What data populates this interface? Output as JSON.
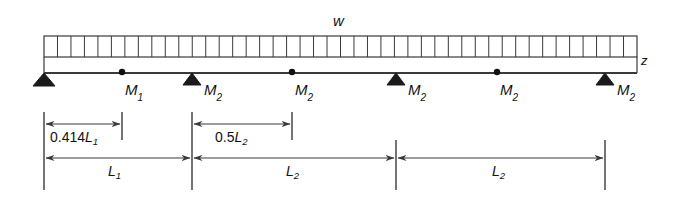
{
  "figure": {
    "load_label": "w",
    "break_symbol": "z",
    "colors": {
      "line": "#3a3a3a",
      "text": "#111111",
      "support_fill": "#1a1a1a",
      "hinge_fill": "#111111"
    }
  },
  "beam": {
    "x_start": 44,
    "x_end": 637,
    "y": 73,
    "load_top": 36,
    "load_bottom": 57,
    "hatch_count": 44
  },
  "supports": [
    {
      "id": "support-1",
      "x": 44,
      "label": ""
    },
    {
      "id": "support-2",
      "x": 192,
      "label": "M"
    },
    {
      "id": "support-3",
      "x": 396,
      "label": "M"
    },
    {
      "id": "support-4",
      "x": 605,
      "label": "M"
    }
  ],
  "moment_labels": [
    {
      "name": "moment-label-1",
      "text": "M",
      "sub": "1",
      "x": 125,
      "y": 82
    },
    {
      "name": "moment-label-2",
      "text": "M",
      "sub": "2",
      "x": 204,
      "y": 82
    },
    {
      "name": "moment-label-3",
      "text": "M",
      "sub": "2",
      "x": 295,
      "y": 82
    },
    {
      "name": "moment-label-4",
      "text": "M",
      "sub": "2",
      "x": 408,
      "y": 82
    },
    {
      "name": "moment-label-5",
      "text": "M",
      "sub": "2",
      "x": 500,
      "y": 82
    },
    {
      "name": "moment-label-6",
      "text": "M",
      "sub": "2",
      "x": 617,
      "y": 82
    }
  ],
  "hinges": [
    {
      "name": "hinge-point-1",
      "x": 122,
      "y": 72
    },
    {
      "name": "hinge-point-2",
      "x": 292,
      "y": 72
    },
    {
      "name": "hinge-point-3",
      "x": 497,
      "y": 72
    }
  ],
  "dimensions": [
    {
      "name": "dimension-0414L1",
      "coefficient": "0.414",
      "symbol": "L",
      "sub": "1",
      "x1": 44,
      "x2": 122,
      "y": 124,
      "label_x": 50,
      "label_y": 130
    },
    {
      "name": "dimension-05L2",
      "coefficient": "0.5",
      "symbol": "L",
      "sub": "2",
      "x1": 192,
      "x2": 292,
      "y": 124,
      "label_x": 215,
      "label_y": 130
    },
    {
      "name": "dimension-L1",
      "coefficient": "",
      "symbol": "L",
      "sub": "1",
      "x1": 44,
      "x2": 192,
      "y": 158,
      "label_x": 108,
      "label_y": 164
    },
    {
      "name": "dimension-L2-first",
      "coefficient": "",
      "symbol": "L",
      "sub": "2",
      "x1": 192,
      "x2": 396,
      "y": 158,
      "label_x": 286,
      "label_y": 164
    },
    {
      "name": "dimension-L2-second",
      "coefficient": "",
      "symbol": "L",
      "sub": "2",
      "x1": 396,
      "x2": 605,
      "y": 158,
      "label_x": 492,
      "label_y": 164
    }
  ],
  "extension_lines": [
    {
      "name": "ext-line-left",
      "x": 44,
      "y1": 112,
      "y2": 190
    },
    {
      "name": "ext-line-hinge1",
      "x": 122,
      "y1": 112,
      "y2": 140
    },
    {
      "name": "ext-line-mid1",
      "x": 192,
      "y1": 112,
      "y2": 190
    },
    {
      "name": "ext-line-hinge2",
      "x": 292,
      "y1": 112,
      "y2": 140
    },
    {
      "name": "ext-line-mid2",
      "x": 396,
      "y1": 140,
      "y2": 190
    },
    {
      "name": "ext-line-right",
      "x": 605,
      "y1": 140,
      "y2": 190
    }
  ]
}
